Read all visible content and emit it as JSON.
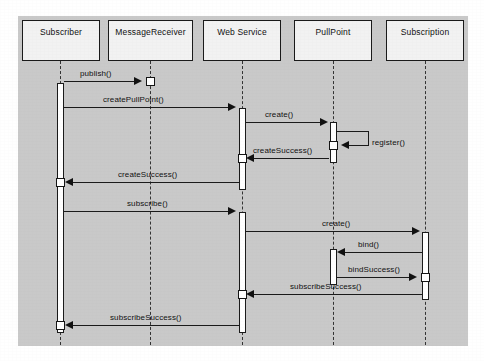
{
  "diagram": {
    "type": "uml-sequence-diagram",
    "title": "",
    "background_color": "#c9c9c9",
    "participants": [
      {
        "id": "subscriber",
        "label": "Subscriber",
        "x": 22,
        "y": 20,
        "width": 78,
        "lifeline_x": 60
      },
      {
        "id": "messagereceiver",
        "label": "MessageReceiver",
        "x": 108,
        "y": 20,
        "width": 85,
        "lifeline_x": 150
      },
      {
        "id": "webservice",
        "label": "Web Service",
        "x": 203,
        "y": 20,
        "width": 78,
        "lifeline_x": 242
      },
      {
        "id": "pullpoint",
        "label": "PullPoint",
        "x": 294,
        "y": 20,
        "width": 78,
        "lifeline_x": 333
      },
      {
        "id": "subscription",
        "label": "Subscription",
        "x": 386,
        "y": 20,
        "width": 78,
        "lifeline_x": 425
      }
    ],
    "messages": [
      {
        "id": "m1",
        "label": "publish()",
        "from": "subscriber",
        "to": "messagereceiver",
        "y": 81,
        "direction": "right"
      },
      {
        "id": "m2",
        "label": "createPullPoint()",
        "from": "subscriber",
        "to": "webservice",
        "y": 107,
        "direction": "right"
      },
      {
        "id": "m3",
        "label": "create()",
        "from": "webservice",
        "to": "pullpoint",
        "y": 122,
        "direction": "right"
      },
      {
        "id": "m4",
        "label": "register()",
        "from": "pullpoint",
        "to": "pullpoint",
        "y": 140,
        "direction": "self"
      },
      {
        "id": "m5",
        "label": "createSuccess()",
        "from": "pullpoint",
        "to": "webservice",
        "y": 158,
        "direction": "left"
      },
      {
        "id": "m6",
        "label": "createSuccess()",
        "from": "webservice",
        "to": "subscriber",
        "y": 182,
        "direction": "left"
      },
      {
        "id": "m7",
        "label": "subscribe()",
        "from": "subscriber",
        "to": "webservice",
        "y": 211,
        "direction": "right"
      },
      {
        "id": "m8",
        "label": "create()",
        "from": "webservice",
        "to": "subscription",
        "y": 231,
        "direction": "right"
      },
      {
        "id": "m9",
        "label": "bind()",
        "from": "subscription",
        "to": "pullpoint",
        "y": 252,
        "direction": "left"
      },
      {
        "id": "m10",
        "label": "bindSuccess()",
        "from": "pullpoint",
        "to": "subscription",
        "y": 277,
        "direction": "right"
      },
      {
        "id": "m11",
        "label": "subscribeSuccess()",
        "from": "subscription",
        "to": "webservice",
        "y": 294,
        "direction": "left"
      },
      {
        "id": "m12",
        "label": "subscribeSuccess()",
        "from": "webservice",
        "to": "subscriber",
        "y": 325,
        "direction": "left"
      }
    ],
    "activations": [
      {
        "id": "a-subscriber",
        "participant": "subscriber",
        "top": 83,
        "height": 250
      },
      {
        "id": "a-webservice-1",
        "participant": "webservice",
        "top": 108,
        "height": 82
      },
      {
        "id": "a-webservice-2",
        "participant": "webservice",
        "top": 212,
        "height": 121
      },
      {
        "id": "a-pullpoint-1",
        "participant": "pullpoint",
        "top": 122,
        "height": 41
      },
      {
        "id": "a-pullpoint-2",
        "participant": "pullpoint",
        "top": 249,
        "height": 36
      },
      {
        "id": "a-subscription-1",
        "participant": "subscription",
        "top": 232,
        "height": 68
      }
    ]
  }
}
